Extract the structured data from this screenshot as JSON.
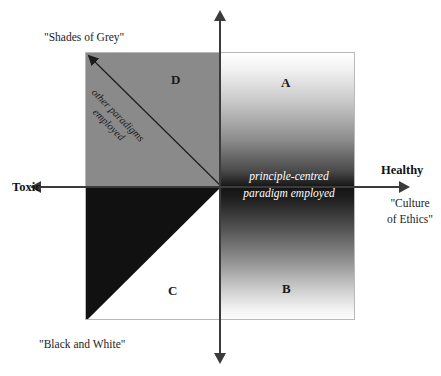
{
  "diagram": {
    "type": "quadrant-matrix",
    "axes": {
      "horizontal": {
        "left_label": "Toxic",
        "right_label": "Healthy",
        "right_sublabel": "\"Culture\nof Ethics\""
      },
      "vertical": {
        "top_label": "\"Shades of Grey\"",
        "bottom_label": "\"Black and White\""
      }
    },
    "quadrants": [
      {
        "letter": "A",
        "position": "upper-right",
        "fill": "gradient-white-to-black-downward"
      },
      {
        "letter": "B",
        "position": "lower-right",
        "fill": "gradient-black-to-white-downward"
      },
      {
        "letter": "C",
        "position": "lower-left",
        "fill": "white-with-black-diagonal-triangle"
      },
      {
        "letter": "D",
        "position": "upper-left",
        "fill": "flat-grey"
      }
    ],
    "captions": {
      "upper_diagonal_line1": "other paradigms",
      "upper_diagonal_line2": "employed",
      "lower_diagonal_line1": "principle-centred",
      "lower_diagonal_line2": "paradigm employed",
      "centre_line1": "principle-centred",
      "centre_line2": "paradigm employed"
    },
    "colors": {
      "grey_quadrant": "#8a8a8a",
      "black_triangle": "#111111",
      "axis": "#3b3b3b",
      "box_border": "#b9b9b9",
      "background": "#ffffff",
      "text": "#111111",
      "inverse_text": "#ffffff"
    }
  }
}
